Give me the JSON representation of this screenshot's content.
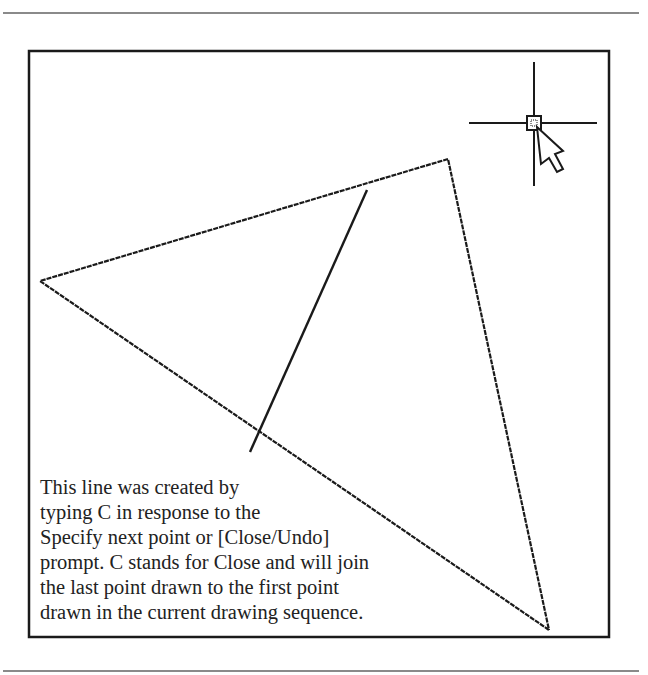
{
  "figure": {
    "frame": {
      "x": 29,
      "y": 51,
      "width": 580,
      "height": 586
    },
    "triangle": {
      "points": [
        [
          40,
          281
        ],
        [
          448,
          159
        ],
        [
          549,
          630
        ]
      ],
      "stroke": "#1a1a1a"
    },
    "close_line": {
      "x1": 367,
      "y1": 190,
      "x2": 250,
      "y2": 452
    },
    "crosshair": {
      "cx": 534,
      "cy": 123,
      "half_h": 62,
      "half_v": 62,
      "box": 7
    },
    "cursor": "arrow-pointer"
  },
  "caption": {
    "lines": [
      "This line was created by",
      "typing C in response to the",
      "Specify next point or [Close/Undo]",
      "prompt. C stands for Close and will join",
      "the last point drawn to the first point",
      "drawn in the current drawing sequence."
    ]
  }
}
